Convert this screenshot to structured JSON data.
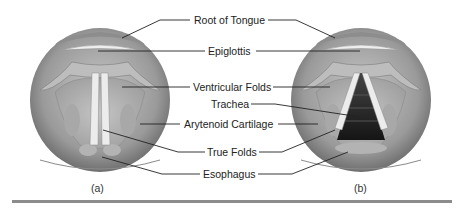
{
  "figure": {
    "panels": [
      {
        "id": "a",
        "caption": "(a)",
        "state": "closed vocal folds"
      },
      {
        "id": "b",
        "caption": "(b)",
        "state": "open vocal folds"
      }
    ],
    "labels": [
      {
        "key": "root_of_tongue",
        "text": "Root of Tongue"
      },
      {
        "key": "epiglottis",
        "text": "Epiglottis"
      },
      {
        "key": "ventricular_folds",
        "text": "Ventricular Folds"
      },
      {
        "key": "trachea",
        "text": "Trachea"
      },
      {
        "key": "arytenoid_cartilage",
        "text": "Arytenoid Cartilage"
      },
      {
        "key": "true_folds",
        "text": "True Folds"
      },
      {
        "key": "esophagus",
        "text": "Esophagus"
      }
    ],
    "colors": {
      "outer_ring": "#8a8a8a",
      "inner_tissue": "#b5b5b5",
      "folds": "#e6e6e6",
      "trachea": "#2a2a2a",
      "leader_line": "#222222",
      "rule": "#8c8c8c"
    }
  }
}
